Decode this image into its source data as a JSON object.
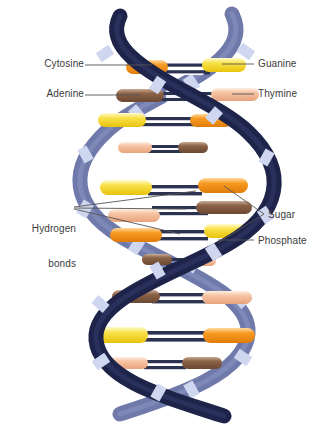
{
  "diagram": {
    "background": "#ffffff",
    "text_color": "#3b3b3b",
    "leader_color": "#555555"
  },
  "labels": {
    "cytosine": "Cytosine",
    "adenine": "Adenine",
    "guanine": "Guanine",
    "thymine": "Thymine",
    "hydrogen_bonds_line1": "Hydrogen",
    "hydrogen_bonds_line2": "bonds",
    "sugar": "Sugar",
    "phosphate": "Phosphate"
  },
  "legend_colors": {
    "cytosine": "#f59322",
    "guanine": "#f5e03a",
    "adenine": "#8a6247",
    "thymine": "#f6c4a4",
    "backbone_front": "#242a52",
    "backbone_back": "#6f7aab",
    "phosphate_band": "#cfd6ef",
    "hydrogen_bond": "#2b3350"
  },
  "base_pairs": [
    {
      "index": 1,
      "y": 68,
      "left": "cytosine",
      "right": "guanine"
    },
    {
      "index": 2,
      "y": 95,
      "left": "adenine",
      "right": "thymine"
    },
    {
      "index": 3,
      "y": 122,
      "left": "guanine",
      "right": "cytosine"
    },
    {
      "index": 4,
      "y": 148,
      "left": "thymine",
      "right": "adenine"
    },
    {
      "index": 5,
      "y": 190,
      "left": "guanine",
      "right": "cytosine"
    },
    {
      "index": 6,
      "y": 213,
      "left": "adenine",
      "right": "thymine"
    },
    {
      "index": 7,
      "y": 232,
      "left": "cytosine",
      "right": "guanine"
    },
    {
      "index": 8,
      "y": 258,
      "left": "adenine",
      "right": "thymine"
    },
    {
      "index": 9,
      "y": 296,
      "left": "adenine",
      "right": "thymine"
    },
    {
      "index": 10,
      "y": 334,
      "left": "guanine",
      "right": "cytosine"
    },
    {
      "index": 11,
      "y": 362,
      "left": "thymine",
      "right": "adenine"
    }
  ],
  "structure": {
    "strand_count": 2,
    "turns": 3,
    "helix_center_x": 165,
    "helix_top_y": 8,
    "helix_bottom_y": 420
  }
}
